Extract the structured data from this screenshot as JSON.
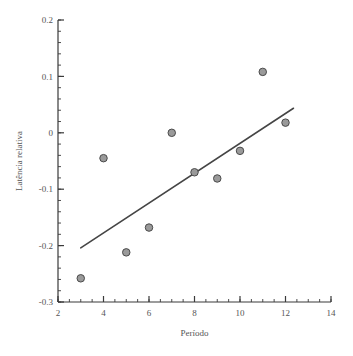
{
  "chart_data": {
    "type": "scatter",
    "title": "",
    "xlabel": "Período",
    "ylabel": "Latência relativa",
    "xlim": [
      2,
      14
    ],
    "ylim": [
      -0.3,
      0.2
    ],
    "grid": false,
    "legend": null,
    "x_ticks": [
      2,
      4,
      6,
      8,
      10,
      12,
      14
    ],
    "x_tick_labels": [
      "2",
      "4",
      "6",
      "8",
      "10",
      "12",
      "14"
    ],
    "x_minor_step": 0.5,
    "y_ticks": [
      -0.3,
      -0.2,
      -0.1,
      0,
      0.1,
      0.2
    ],
    "y_tick_labels": [
      "-0.3",
      "-0.2",
      "-0.1",
      "0",
      "0.1",
      "0.2"
    ],
    "y_minor_step": 0.02,
    "series": [
      {
        "name": "observações",
        "type": "scatter",
        "marker": "circle",
        "marker_color": "#9a9a9a",
        "marker_edge_color": "#4a4a4a",
        "marker_size": 7.5,
        "x": [
          3,
          4,
          5,
          6,
          7,
          8,
          9,
          10,
          11,
          12
        ],
        "y": [
          -0.258,
          -0.045,
          -0.212,
          -0.168,
          0.0,
          -0.07,
          -0.081,
          -0.032,
          0.108,
          0.018
        ],
        "points": [
          {
            "x": 3,
            "y": -0.258
          },
          {
            "x": 4,
            "y": -0.045
          },
          {
            "x": 5,
            "y": -0.212
          },
          {
            "x": 6,
            "y": -0.168
          },
          {
            "x": 7,
            "y": 0.0
          },
          {
            "x": 8,
            "y": -0.07
          },
          {
            "x": 9,
            "y": -0.081
          },
          {
            "x": 10,
            "y": -0.032
          },
          {
            "x": 11,
            "y": 0.108
          },
          {
            "x": 12,
            "y": 0.018
          }
        ]
      },
      {
        "name": "linha de tendência",
        "type": "line",
        "line_color": "#454545",
        "line_width": 1.6,
        "x": [
          3.0,
          12.35
        ],
        "y": [
          -0.204,
          0.0435
        ]
      }
    ],
    "axis_color": "#3a3a3a",
    "text_color": "#555555",
    "background": "#ffffff"
  },
  "geometry": {
    "plot_left": 58,
    "plot_right": 331,
    "plot_top": 20,
    "plot_bottom": 302
  }
}
